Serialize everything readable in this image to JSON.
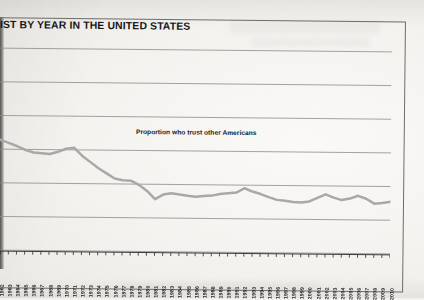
{
  "document": {
    "title": "IST BY YEAR IN THE UNITED STATES",
    "title_note_cropped": true
  },
  "chart_data": {
    "type": "line",
    "title": "IST BY YEAR IN THE UNITED STATES",
    "annotation": "Proportion who trust other Americans",
    "xlabel": "",
    "ylabel": "",
    "grid": true,
    "gridlines": 7,
    "legend": "none",
    "series_color": "#a7a7a5",
    "xlim": [
      1960,
      2010
    ],
    "ylim": [
      0,
      1
    ],
    "categories": [
      "1960",
      "1961",
      "1962",
      "1963",
      "1964",
      "1965",
      "1966",
      "1967",
      "1968",
      "1969",
      "1970",
      "1971",
      "1972",
      "1973",
      "1974",
      "1975",
      "1976",
      "1977",
      "1978",
      "1979",
      "1980",
      "1981",
      "1982",
      "1983",
      "1984",
      "1985",
      "1986",
      "1987",
      "1988",
      "1989",
      "1990",
      "1991",
      "1992",
      "1993",
      "1994",
      "1995",
      "1996",
      "1997",
      "1998",
      "1999",
      "2000",
      "2001",
      "2002",
      "2003",
      "2004",
      "2005",
      "2006",
      "2007",
      "2008",
      "2009",
      "2010"
    ],
    "series": [
      {
        "name": "Proportion who trust other Americans",
        "values": [
          0.575,
          0.56,
          0.545,
          0.53,
          0.515,
          0.497,
          0.485,
          0.482,
          0.478,
          0.49,
          0.505,
          0.51,
          0.47,
          0.44,
          0.41,
          0.385,
          0.36,
          0.352,
          0.35,
          0.33,
          0.3,
          0.26,
          0.283,
          0.29,
          0.284,
          0.278,
          0.274,
          0.278,
          0.28,
          0.288,
          0.292,
          0.296,
          0.318,
          0.302,
          0.29,
          0.275,
          0.262,
          0.258,
          0.252,
          0.25,
          0.256,
          0.274,
          0.292,
          0.276,
          0.264,
          0.272,
          0.286,
          0.272,
          0.248,
          0.252,
          0.258
        ]
      }
    ]
  }
}
